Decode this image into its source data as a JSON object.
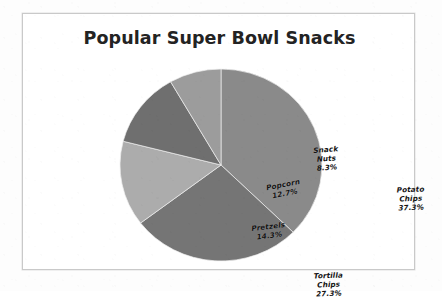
{
  "chart_data": {
    "type": "pie",
    "title": "Popular Super Bowl Snacks",
    "categories": [
      "Potato Chips",
      "Tortilla Chips",
      "Pretzels",
      "Popcorn",
      "Snack Nuts"
    ],
    "values": [
      37.3,
      27.3,
      14.3,
      12.7,
      8.3
    ],
    "value_suffix": "%",
    "start_angle_deg": 0,
    "direction": "clockwise",
    "legend": "none",
    "labels_position": "inside-slice",
    "grid": false,
    "slices": [
      {
        "name": "Potato Chips",
        "value": 37.3,
        "label": "37.3%",
        "color": "#8a8a8a",
        "name_lines": [
          "Potato",
          "Chips"
        ]
      },
      {
        "name": "Tortilla Chips",
        "value": 27.3,
        "label": "27.3%",
        "color": "#757575",
        "name_lines": [
          "Tortilla",
          "Chips"
        ]
      },
      {
        "name": "Pretzels",
        "value": 14.3,
        "label": "14.3%",
        "color": "#adadad",
        "name_lines": [
          "Pretzels"
        ]
      },
      {
        "name": "Popcorn",
        "value": 12.7,
        "label": "12.7%",
        "color": "#6e6e6e",
        "name_lines": [
          "Popcorn"
        ]
      },
      {
        "name": "Snack Nuts",
        "value": 8.3,
        "label": "8.3%",
        "color": "#9d9d9d",
        "name_lines": [
          "Snack",
          "Nuts"
        ]
      }
    ]
  },
  "chart": {
    "title": "Popular Super Bowl Snacks",
    "border_color": "#c9c9c9",
    "background": "#ffffff"
  },
  "labels": {
    "potato_name_1": "Potato",
    "potato_name_2": "Chips",
    "potato_pct": "37.3%",
    "tortilla_name_1": "Tortilla",
    "tortilla_name_2": "Chips",
    "tortilla_pct": "27.3%",
    "pretzels_name": "Pretzels",
    "pretzels_pct": "14.3%",
    "popcorn_name": "Popcorn",
    "popcorn_pct": "12.7%",
    "nuts_name_1": "Snack",
    "nuts_name_2": "Nuts",
    "nuts_pct": "8.3%"
  }
}
